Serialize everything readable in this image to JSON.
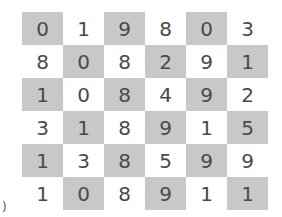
{
  "grid": {
    "rows": [
      [
        {
          "v": "0",
          "s": true
        },
        {
          "v": "1",
          "s": false
        },
        {
          "v": "9",
          "s": true
        },
        {
          "v": "8",
          "s": false
        },
        {
          "v": "0",
          "s": true
        },
        {
          "v": "3",
          "s": false
        }
      ],
      [
        {
          "v": "8",
          "s": false
        },
        {
          "v": "0",
          "s": true
        },
        {
          "v": "8",
          "s": false
        },
        {
          "v": "2",
          "s": true
        },
        {
          "v": "9",
          "s": false
        },
        {
          "v": "1",
          "s": true
        }
      ],
      [
        {
          "v": "1",
          "s": true
        },
        {
          "v": "0",
          "s": false
        },
        {
          "v": "8",
          "s": true
        },
        {
          "v": "4",
          "s": false
        },
        {
          "v": "9",
          "s": true
        },
        {
          "v": "2",
          "s": false
        }
      ],
      [
        {
          "v": "3",
          "s": false
        },
        {
          "v": "1",
          "s": true
        },
        {
          "v": "8",
          "s": false
        },
        {
          "v": "9",
          "s": true
        },
        {
          "v": "1",
          "s": false
        },
        {
          "v": "5",
          "s": true
        }
      ],
      [
        {
          "v": "1",
          "s": true
        },
        {
          "v": "3",
          "s": false
        },
        {
          "v": "8",
          "s": true
        },
        {
          "v": "5",
          "s": false
        },
        {
          "v": "9",
          "s": true
        },
        {
          "v": "9",
          "s": false
        }
      ],
      [
        {
          "v": "1",
          "s": false
        },
        {
          "v": "0",
          "s": true
        },
        {
          "v": "8",
          "s": false
        },
        {
          "v": "9",
          "s": true
        },
        {
          "v": "1",
          "s": false
        },
        {
          "v": "1",
          "s": true
        }
      ]
    ],
    "shade_color": "#c8c8c8",
    "text_color": "#4a4a4a"
  },
  "stray_text": ")"
}
